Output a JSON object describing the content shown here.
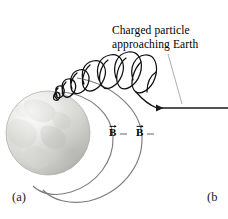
{
  "figure": {
    "type": "physics-diagram",
    "background_color": "#ffffff"
  },
  "annotation": {
    "line1": "Charged particle",
    "line2": "approaching Earth",
    "leader_line": "thin-gray-line-from-text-to-arrow"
  },
  "field_labels": [
    {
      "symbol": "B",
      "notation": "vector-arrow-overbar",
      "x": 109,
      "y": 127
    },
    {
      "symbol": "B",
      "notation": "vector-arrow-overbar",
      "x": 136,
      "y": 127
    }
  ],
  "panels": {
    "a": "(a)",
    "b": "(b"
  },
  "colors": {
    "earth_light": "#e8e8e6",
    "earth_mid": "#d2d2d0",
    "earth_shadow": "#b6b6b4",
    "continent": "#cfcfcb",
    "field_line": "#7d7d7d",
    "trajectory": "#111111",
    "arrow": "#1a1a1a",
    "leader": "#9a9a9a",
    "text": "#000000"
  },
  "elements": {
    "earth": {
      "cx": 48,
      "cy": 133,
      "r": 42,
      "name": "earth-sphere"
    },
    "field_lines": [
      {
        "name": "inner-field-line"
      },
      {
        "name": "outer-field-line"
      }
    ],
    "trajectory": {
      "name": "helical-particle-path",
      "loops": 8
    },
    "incoming_arrow": {
      "name": "particle-velocity-arrow",
      "direction": "left",
      "x_start": 228,
      "x_end": 152,
      "y": 108
    }
  }
}
